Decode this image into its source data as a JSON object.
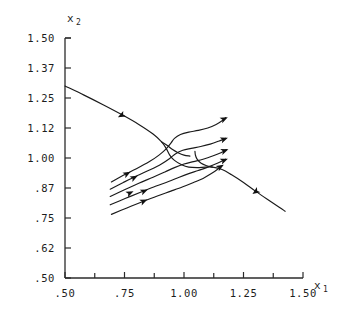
{
  "chart_data": {
    "type": "line",
    "title": "",
    "xlabel": "x1",
    "ylabel": "x2",
    "xlabel_base": "x",
    "xlabel_sub": "1",
    "ylabel_base": "x",
    "ylabel_sub": "2",
    "grid": false,
    "legend": "none",
    "xlim": [
      0.5,
      1.5
    ],
    "ylim": [
      0.5,
      1.5
    ],
    "xticks": [
      ".50",
      ".75",
      "1.00",
      "1.25",
      "1.50"
    ],
    "xtick_values": [
      0.5,
      0.75,
      1.0,
      1.25,
      1.5
    ],
    "xminor_values": [
      0.625,
      0.875,
      1.125,
      1.375
    ],
    "yticks": [
      "1.50",
      "1.37",
      "1.25",
      "1.12",
      "1.00",
      ".87",
      ".75",
      ".62",
      ".50"
    ],
    "ytick_values": [
      1.5,
      1.375,
      1.25,
      1.125,
      1.0,
      0.875,
      0.75,
      0.625,
      0.5
    ],
    "series": [
      {
        "name": "separatrix-incoming",
        "role": "separatrix",
        "points": [
          [
            0.5,
            1.3
          ],
          [
            0.58,
            1.262
          ],
          [
            0.66,
            1.222
          ],
          [
            0.74,
            1.18
          ],
          [
            0.81,
            1.14
          ],
          [
            0.87,
            1.1
          ],
          [
            0.905,
            1.068
          ],
          [
            0.925,
            1.04
          ],
          [
            0.94,
            1.012
          ],
          [
            0.96,
            0.99
          ],
          [
            0.99,
            0.972
          ],
          [
            1.02,
            0.962
          ],
          [
            1.055,
            0.96
          ],
          [
            1.09,
            0.962
          ],
          [
            1.12,
            0.962
          ],
          [
            1.16,
            0.952
          ],
          [
            1.2,
            0.93
          ],
          [
            1.25,
            0.898
          ],
          [
            1.3,
            0.862
          ],
          [
            1.35,
            0.828
          ],
          [
            1.4,
            0.795
          ],
          [
            1.425,
            0.778
          ]
        ]
      },
      {
        "name": "trajectory-1",
        "role": "trajectory",
        "points": [
          [
            0.695,
            0.9
          ],
          [
            0.745,
            0.928
          ],
          [
            0.8,
            0.955
          ],
          [
            0.855,
            0.985
          ],
          [
            0.895,
            1.012
          ],
          [
            0.925,
            1.038
          ],
          [
            0.945,
            1.062
          ],
          [
            0.96,
            1.082
          ],
          [
            0.985,
            1.098
          ],
          [
            1.02,
            1.108
          ],
          [
            1.06,
            1.115
          ],
          [
            1.1,
            1.125
          ],
          [
            1.135,
            1.14
          ],
          [
            1.16,
            1.155
          ],
          [
            1.175,
            1.168
          ]
        ]
      },
      {
        "name": "trajectory-2",
        "role": "trajectory",
        "points": [
          [
            0.69,
            0.87
          ],
          [
            0.745,
            0.898
          ],
          [
            0.8,
            0.925
          ],
          [
            0.86,
            0.952
          ],
          [
            0.905,
            0.975
          ],
          [
            0.94,
            0.998
          ],
          [
            0.965,
            1.018
          ],
          [
            0.995,
            1.032
          ],
          [
            1.03,
            1.04
          ],
          [
            1.07,
            1.048
          ],
          [
            1.11,
            1.058
          ],
          [
            1.145,
            1.07
          ],
          [
            1.175,
            1.082
          ]
        ]
      },
      {
        "name": "trajectory-3",
        "role": "trajectory",
        "points": [
          [
            0.69,
            0.84
          ],
          [
            0.75,
            0.868
          ],
          [
            0.81,
            0.895
          ],
          [
            0.87,
            0.92
          ],
          [
            0.92,
            0.942
          ],
          [
            0.96,
            0.96
          ],
          [
            1.0,
            0.975
          ],
          [
            1.04,
            0.985
          ],
          [
            1.08,
            0.995
          ],
          [
            1.12,
            1.008
          ],
          [
            1.155,
            1.022
          ],
          [
            1.178,
            1.035
          ]
        ]
      },
      {
        "name": "trajectory-4",
        "role": "trajectory",
        "points": [
          [
            0.69,
            0.805
          ],
          [
            0.755,
            0.832
          ],
          [
            0.82,
            0.858
          ],
          [
            0.88,
            0.882
          ],
          [
            0.935,
            0.902
          ],
          [
            0.98,
            0.92
          ],
          [
            1.02,
            0.935
          ],
          [
            1.06,
            0.948
          ],
          [
            1.1,
            0.962
          ],
          [
            1.14,
            0.978
          ],
          [
            1.175,
            0.995
          ]
        ]
      },
      {
        "name": "trajectory-5",
        "role": "trajectory",
        "points": [
          [
            0.695,
            0.765
          ],
          [
            0.76,
            0.792
          ],
          [
            0.825,
            0.818
          ],
          [
            0.888,
            0.842
          ],
          [
            0.945,
            0.862
          ],
          [
            0.995,
            0.88
          ],
          [
            1.04,
            0.898
          ],
          [
            1.08,
            0.915
          ],
          [
            1.115,
            0.935
          ],
          [
            1.14,
            0.952
          ],
          [
            1.158,
            0.968
          ]
        ]
      },
      {
        "name": "saddle-branch-upper-left",
        "role": "separatrix-branch",
        "points": [
          [
            0.905,
            1.068
          ],
          [
            0.93,
            1.052
          ],
          [
            0.952,
            1.035
          ],
          [
            0.975,
            1.022
          ],
          [
            1.0,
            1.012
          ],
          [
            1.025,
            1.008
          ]
        ]
      },
      {
        "name": "saddle-branch-lower-right",
        "role": "separatrix-branch",
        "points": [
          [
            1.12,
            0.962
          ],
          [
            1.095,
            0.968
          ],
          [
            1.072,
            0.978
          ],
          [
            1.055,
            0.995
          ],
          [
            1.048,
            1.012
          ],
          [
            1.046,
            1.028
          ]
        ]
      }
    ],
    "arrow_markers": [
      {
        "x": 0.738,
        "y": 1.178,
        "angle": 207,
        "on": "separatrix-incoming"
      },
      {
        "x": 1.302,
        "y": 0.86,
        "angle": 215,
        "on": "separatrix-incoming"
      },
      {
        "x": 1.168,
        "y": 1.162,
        "angle": 25,
        "on": "trajectory-1"
      },
      {
        "x": 1.168,
        "y": 1.078,
        "angle": 20,
        "on": "trajectory-2"
      },
      {
        "x": 1.17,
        "y": 1.03,
        "angle": 20,
        "on": "trajectory-3"
      },
      {
        "x": 1.168,
        "y": 0.99,
        "angle": 22,
        "on": "trajectory-4"
      },
      {
        "x": 1.152,
        "y": 0.963,
        "angle": 30,
        "on": "trajectory-5"
      },
      {
        "x": 0.76,
        "y": 0.934,
        "angle": 28,
        "on": "trajectory-1"
      },
      {
        "x": 0.79,
        "y": 0.918,
        "angle": 27,
        "on": "trajectory-2"
      },
      {
        "x": 0.772,
        "y": 0.854,
        "angle": 25,
        "on": "trajectory-3"
      },
      {
        "x": 0.832,
        "y": 0.862,
        "angle": 24,
        "on": "trajectory-4"
      },
      {
        "x": 0.83,
        "y": 0.82,
        "angle": 24,
        "on": "trajectory-5"
      }
    ]
  },
  "axes": {
    "x_axis_name": "x-axis",
    "y_axis_name": "y-axis"
  }
}
